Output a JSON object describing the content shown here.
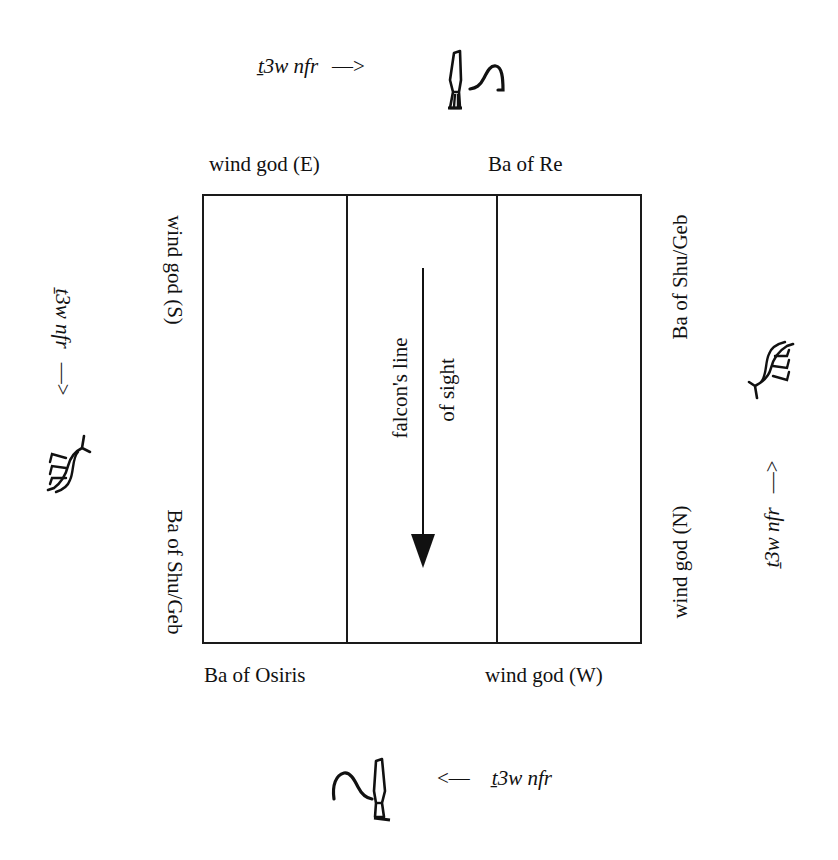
{
  "diagram": {
    "type": "orientation-diagram",
    "top": {
      "inscription": "ṯ3w nfr",
      "arrow": "—>",
      "glyph": "hieroglyph-pair-knife-and-arch"
    },
    "bottom": {
      "inscription": "ṯ3w nfr",
      "arrow": "<—",
      "glyph": "hieroglyph-pair-arch-and-knife"
    },
    "left": {
      "inscription": "ṯ3w nfr",
      "arrow": "—>",
      "glyph": "hieroglyph-animal"
    },
    "right": {
      "inscription": "ṯ3w nfr",
      "arrow": "—>",
      "glyph": "hieroglyph-animal"
    },
    "corner_labels": {
      "top_left": "wind god (E)",
      "top_right": "Ba of Re",
      "left_top": "wind god (S)",
      "left_bottom": "Ba of Shu/Geb",
      "right_top": "Ba of Shu/Geb",
      "right_bottom": "wind god (N)",
      "bottom_left": "Ba of Osiris",
      "bottom_right": "wind god (W)"
    },
    "center": {
      "line1": "falcon's line",
      "line2": "of sight",
      "arrow_direction": "down"
    },
    "colors": {
      "ink": "#111111",
      "background": "#ffffff"
    }
  }
}
